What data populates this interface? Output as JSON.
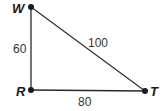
{
  "diagram": {
    "type": "right-triangle",
    "vertices": [
      {
        "id": "W",
        "label": "W",
        "x": 31,
        "y": 7
      },
      {
        "id": "R",
        "label": "R",
        "x": 31,
        "y": 90
      },
      {
        "id": "T",
        "label": "T",
        "x": 145,
        "y": 91
      }
    ],
    "sides": [
      {
        "from": "W",
        "to": "R",
        "label": "60"
      },
      {
        "from": "W",
        "to": "T",
        "label": "100"
      },
      {
        "from": "R",
        "to": "T",
        "label": "80"
      }
    ],
    "colors": {
      "line": "#2a2a2a",
      "point": "#1a1a1a"
    }
  }
}
